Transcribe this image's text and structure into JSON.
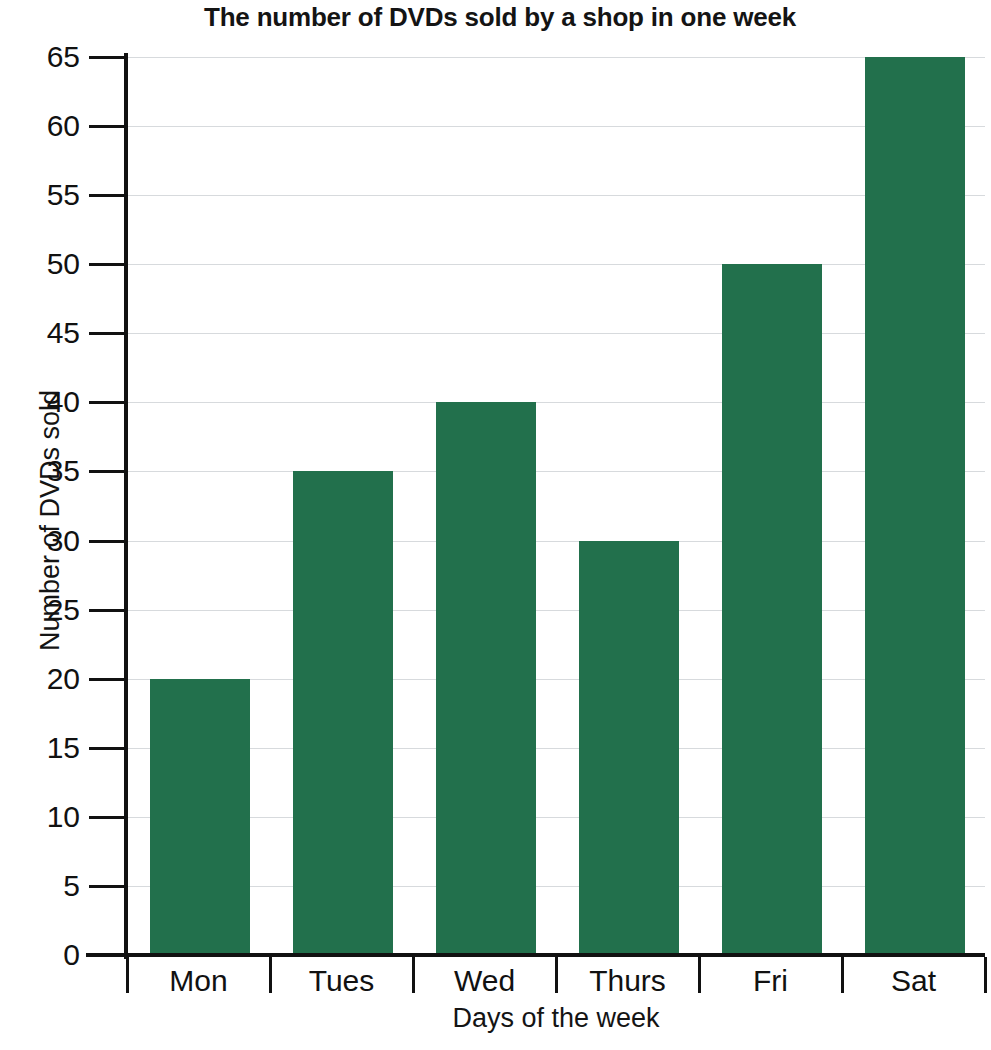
{
  "chart_data": {
    "type": "bar",
    "title": "The number of DVDs sold by a shop in one week",
    "xlabel": "Days of the week",
    "ylabel": "Number of DVDs sold",
    "categories": [
      "Mon",
      "Tues",
      "Wed",
      "Thurs",
      "Fri",
      "Sat"
    ],
    "values": [
      20,
      35,
      40,
      30,
      50,
      65
    ],
    "ylim": [
      0,
      65
    ],
    "ytick_labels": [
      "0",
      "5",
      "10",
      "15",
      "20",
      "25",
      "30",
      "35",
      "40",
      "45",
      "50",
      "55",
      "60",
      "65"
    ],
    "ytick_values": [
      0,
      5,
      10,
      15,
      20,
      25,
      30,
      35,
      40,
      45,
      50,
      55,
      60,
      65
    ],
    "ytick_step": 5,
    "grid": "horizontal",
    "legend": "none",
    "bar_color": "#22704c",
    "gridline_color": "#d7dadd",
    "axis_color": "#111111",
    "background_color": "#ffffff"
  }
}
